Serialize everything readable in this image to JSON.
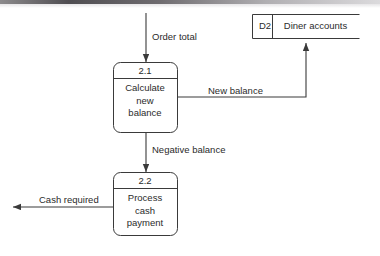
{
  "diagram": {
    "type": "data-flow-diagram",
    "title": "",
    "stroke_color": "#3a3a3a",
    "text_color": "#2b2b2b",
    "background": "#ffffff",
    "processes": [
      {
        "id": "2.1",
        "name_line1": "Calculate",
        "name_line2": "new",
        "name_line3": "balance"
      },
      {
        "id": "2.2",
        "name_line1": "Process",
        "name_line2": "cash",
        "name_line3": "payment"
      }
    ],
    "data_stores": [
      {
        "id": "D2",
        "name": "Diner accounts"
      }
    ],
    "flows": [
      {
        "label": "Order total",
        "from": "external",
        "to": "2.1"
      },
      {
        "label": "New balance",
        "from": "2.1",
        "to": "D2"
      },
      {
        "label": "Negative balance",
        "from": "2.1",
        "to": "2.2"
      },
      {
        "label": "Cash required",
        "from": "2.2",
        "to": "external"
      }
    ]
  }
}
